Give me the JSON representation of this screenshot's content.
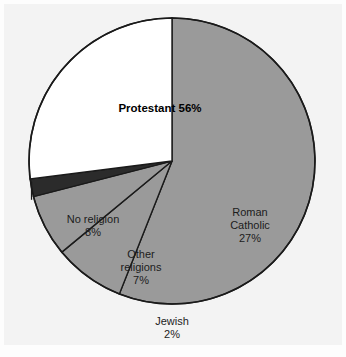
{
  "figure": {
    "background_color": "#f3f3f3",
    "outer_color": "#fdfdfd"
  },
  "chart_data": {
    "type": "pie",
    "title": "",
    "subtitle": "",
    "xlabel": "",
    "ylabel": "",
    "grid": false,
    "legend_position": "none",
    "labels_inside": true,
    "units": "percent",
    "total": 100,
    "start_angle_deg": 90,
    "direction": "clockwise",
    "categories": [
      "Protestant",
      "Roman Catholic",
      "Jewish",
      "Other religions",
      "No religion"
    ],
    "values": [
      56,
      27,
      2,
      7,
      8
    ],
    "colors": [
      "#9a9a9a",
      "#ffffff",
      "#2b2b2b",
      "#9a9a9a",
      "#9a9a9a"
    ],
    "slices": [
      {
        "name": "Protestant",
        "value": 56,
        "value_label": "56%",
        "label_line1": "Protestant 56%",
        "label_line2": "",
        "label_line3": "",
        "color": "#9a9a9a",
        "bold": true,
        "leader_line": false
      },
      {
        "name": "Roman Catholic",
        "value": 27,
        "value_label": "27%",
        "label_line1": "Roman",
        "label_line2": "Catholic",
        "label_line3": "27%",
        "color": "#ffffff",
        "bold": false,
        "leader_line": false
      },
      {
        "name": "Jewish",
        "value": 2,
        "value_label": "2%",
        "label_line1": "Jewish",
        "label_line2": "2%",
        "label_line3": "",
        "color": "#2b2b2b",
        "bold": false,
        "leader_line": true
      },
      {
        "name": "Other religions",
        "value": 7,
        "value_label": "7%",
        "label_line1": "Other",
        "label_line2": "religions",
        "label_line3": "7%",
        "color": "#9a9a9a",
        "bold": false,
        "leader_line": false
      },
      {
        "name": "No religion",
        "value": 8,
        "value_label": "8%",
        "label_line1": "No religion",
        "label_line2": "8%",
        "label_line3": "",
        "color": "#9a9a9a",
        "bold": false,
        "leader_line": false
      }
    ]
  }
}
